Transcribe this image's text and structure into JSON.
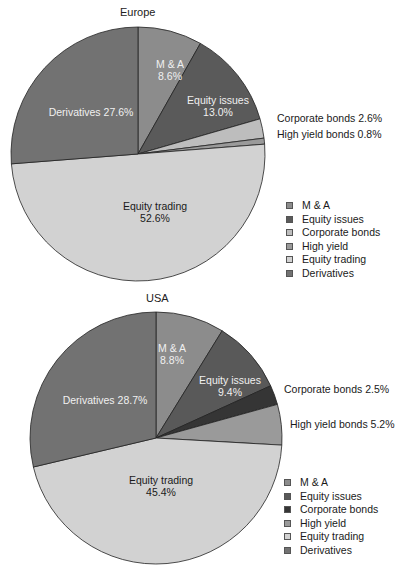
{
  "chart_data": [
    {
      "type": "pie",
      "title": "Europe",
      "categories": [
        "M & A",
        "Equity issues",
        "Corporate bonds",
        "High yield",
        "Equity trading",
        "Derivatives"
      ],
      "values": [
        8.6,
        13.0,
        2.6,
        0.8,
        52.6,
        27.6
      ],
      "labels": [
        "M & A\n8.6%",
        "Equity issues\n13.0%",
        "Corporate bonds 2.6%",
        "High yield bonds 0.8%",
        "Equity trading\n52.6%",
        "Derivatives 27.6%"
      ],
      "colors": [
        "#8c8c8c",
        "#5a5a5a",
        "#bdbdbd",
        "#9a9a9a",
        "#d2d2d2",
        "#727272"
      ],
      "start_angle": "12 o'clock, clockwise",
      "legend": [
        "M & A",
        "Equity issues",
        "Corporate bonds",
        "High yield",
        "Equity trading",
        "Derivatives"
      ],
      "legend_position": "right-bottom"
    },
    {
      "type": "pie",
      "title": "USA",
      "categories": [
        "M & A",
        "Equity issues",
        "Corporate bonds",
        "High yield",
        "Equity trading",
        "Derivatives"
      ],
      "values": [
        8.8,
        9.4,
        2.5,
        5.2,
        45.4,
        28.7
      ],
      "labels": [
        "M & A\n8.8%",
        "Equity issues\n9.4%",
        "Corporate bonds 2.5%",
        "High yield bonds 5.2%",
        "Equity trading\n45.4%",
        "Derivatives 28.7%"
      ],
      "colors": [
        "#8c8c8c",
        "#595959",
        "#353535",
        "#9a9a9a",
        "#d2d2d2",
        "#727272"
      ],
      "start_angle": "12 o'clock, clockwise",
      "legend": [
        "M & A",
        "Equity issues",
        "Corporate bonds",
        "High yield",
        "Equity trading",
        "Derivatives"
      ],
      "legend_position": "right-bottom"
    }
  ],
  "europe": {
    "title": "Europe",
    "labels": {
      "ma": "M & A",
      "ma_pct": "8.6%",
      "equity_issues": "Equity issues",
      "equity_issues_pct": "13.0%",
      "derivatives": "Derivatives 27.6%",
      "equity_trading": "Equity trading",
      "equity_trading_pct": "52.6%",
      "corporate_bonds": "Corporate bonds 2.6%",
      "high_yield": "High yield bonds 0.8%"
    },
    "legend": [
      "M & A",
      "Equity issues",
      "Corporate bonds",
      "High yield",
      "Equity trading",
      "Derivatives"
    ]
  },
  "usa": {
    "title": "USA",
    "labels": {
      "ma": "M & A",
      "ma_pct": "8.8%",
      "equity_issues": "Equity issues",
      "equity_issues_pct": "9.4%",
      "derivatives": "Derivatives 28.7%",
      "equity_trading": "Equity trading",
      "equity_trading_pct": "45.4%",
      "corporate_bonds": "Corporate bonds 2.5%",
      "high_yield": "High yield bonds 5.2%"
    },
    "legend": [
      "M & A",
      "Equity issues",
      "Corporate bonds",
      "High yield",
      "Equity trading",
      "Derivatives"
    ]
  }
}
